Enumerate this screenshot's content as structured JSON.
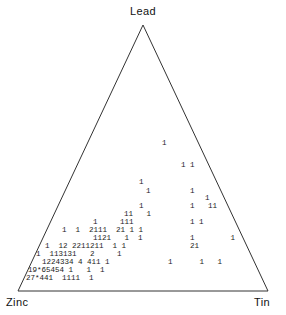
{
  "figure": {
    "type": "ternary-density-plot",
    "vertices": {
      "top": "Lead",
      "bottom_left": "Zinc",
      "bottom_right": "Tin"
    },
    "overflow_marker": "*",
    "line_color": "#333333",
    "text_color": "#1a1a1a",
    "background_color": "#ffffff"
  },
  "chart_data": {
    "type": "scatter",
    "title": "",
    "xlabel": "",
    "ylabel": "",
    "axes": [
      "Lead",
      "Zinc",
      "Tin"
    ],
    "legend": [],
    "grid": false,
    "rows": [
      {
        "id": "row-1",
        "x": 162,
        "y": 139,
        "text": "1"
      },
      {
        "id": "row-2",
        "x": 181,
        "y": 161,
        "text": "1 1"
      },
      {
        "id": "row-3",
        "x": 139,
        "y": 178,
        "text": "1"
      },
      {
        "id": "row-4",
        "x": 146,
        "y": 187,
        "text": "1"
      },
      {
        "id": "row-5",
        "x": 190,
        "y": 187,
        "text": "1"
      },
      {
        "id": "row-6",
        "x": 205,
        "y": 194,
        "text": "1"
      },
      {
        "id": "row-7",
        "x": 139,
        "y": 202,
        "text": "1"
      },
      {
        "id": "row-8",
        "x": 190,
        "y": 202,
        "text": "1   11"
      },
      {
        "id": "row-9",
        "x": 124,
        "y": 210,
        "text": "11   1"
      },
      {
        "id": "row-10",
        "x": 93,
        "y": 218,
        "text": "1     111"
      },
      {
        "id": "row-11",
        "x": 190,
        "y": 218,
        "text": "1 1"
      },
      {
        "id": "row-12",
        "x": 62,
        "y": 226,
        "text": "1  1  2111  21 1 1"
      },
      {
        "id": "row-13",
        "x": 93,
        "y": 234,
        "text": "1121   1  1"
      },
      {
        "id": "row-14",
        "x": 190,
        "y": 234,
        "text": "1        1"
      },
      {
        "id": "row-15",
        "x": 45,
        "y": 242,
        "text": "1  12 2211211  1 1"
      },
      {
        "id": "row-16",
        "x": 190,
        "y": 242,
        "text": "21"
      },
      {
        "id": "row-17",
        "x": 36,
        "y": 250,
        "text": "1  113131   2     1"
      },
      {
        "id": "row-18",
        "x": 42,
        "y": 258,
        "text": "1224334 4 411 1"
      },
      {
        "id": "row-19",
        "x": 168,
        "y": 258,
        "text": "1      1   1"
      },
      {
        "id": "row-20",
        "x": 28,
        "y": 266,
        "text": "19*65454 1   1  1"
      },
      {
        "id": "row-21",
        "x": 26,
        "y": 274,
        "text": "27*441  1111  1"
      }
    ],
    "geometry": {
      "apex": [
        143,
        25
      ],
      "bottom_left": [
        18,
        291
      ],
      "bottom_right": [
        268,
        291
      ]
    }
  }
}
